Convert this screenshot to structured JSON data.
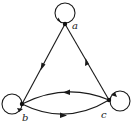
{
  "diagram": {
    "type": "directed-graph",
    "colors": {
      "stroke": "#1a1a1a",
      "background": "#ffffff"
    },
    "vertices": [
      {
        "id": "a",
        "label": "a",
        "x": 65,
        "y": 24
      },
      {
        "id": "b",
        "label": "b",
        "x": 22,
        "y": 104
      },
      {
        "id": "c",
        "label": "c",
        "x": 109,
        "y": 100
      }
    ],
    "edges": [
      {
        "from": "a",
        "to": "a",
        "kind": "loop"
      },
      {
        "from": "b",
        "to": "b",
        "kind": "loop"
      },
      {
        "from": "c",
        "to": "c",
        "kind": "loop"
      },
      {
        "from": "a",
        "to": "b",
        "kind": "straight"
      },
      {
        "from": "c",
        "to": "a",
        "kind": "straight"
      },
      {
        "from": "c",
        "to": "b",
        "kind": "arc-upper"
      },
      {
        "from": "b",
        "to": "c",
        "kind": "arc-lower"
      }
    ]
  }
}
